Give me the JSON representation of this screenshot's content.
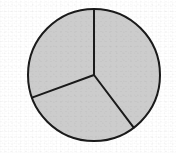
{
  "figure": {
    "kind": "pie-chart",
    "title": "",
    "subtitle": "",
    "background_color": "#ffffff",
    "slice_fill_color": "#cccccc",
    "outline_color": "#1a1a1a",
    "outline_width_px": 2,
    "divider_width_px": 2,
    "center_x_px": 94,
    "center_y_px": 75,
    "radius_px": 66,
    "labels_visible": false,
    "legend_visible": false,
    "values_visible": false,
    "percent_labels_visible": false
  },
  "chart_data": {
    "type": "pie",
    "title": "",
    "xlabel": "",
    "ylabel": "",
    "grid": false,
    "legend_position": "none",
    "labels_shown": false,
    "start_angle_deg": 0,
    "direction": "clockwise",
    "categories": [
      "Slice 1",
      "Slice 2",
      "Slice 3"
    ],
    "values": [
      40,
      30,
      30
    ],
    "angles_deg": [
      143,
      107,
      110
    ],
    "fractions": [
      0.397,
      0.297,
      0.306
    ],
    "slices": [
      {
        "name": "Slice 1",
        "value": 40,
        "fraction": 0.397,
        "angle_deg": 143,
        "start_angle_deg": 0,
        "end_angle_deg": 143,
        "fill": "#cccccc",
        "label": "",
        "position": "right"
      },
      {
        "name": "Slice 2",
        "value": 30,
        "fraction": 0.297,
        "angle_deg": 107,
        "start_angle_deg": 143,
        "end_angle_deg": 250,
        "fill": "#cccccc",
        "label": "",
        "position": "bottom-left"
      },
      {
        "name": "Slice 3",
        "value": 30,
        "fraction": 0.306,
        "angle_deg": 110,
        "start_angle_deg": 250,
        "end_angle_deg": 360,
        "fill": "#cccccc",
        "label": "",
        "position": "upper-left"
      }
    ]
  }
}
